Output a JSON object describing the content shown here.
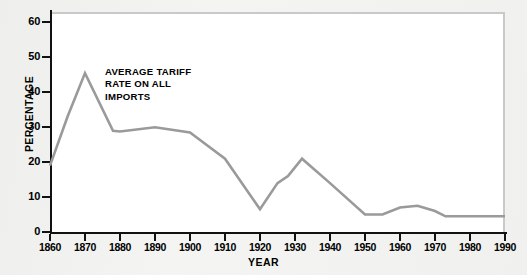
{
  "chart_data": {
    "type": "line",
    "title": "",
    "annotation": "AVERAGE TARIFF\nRATE ON ALL\nIMPORTS",
    "xlabel": "YEAR",
    "ylabel": "PERCENTAGE",
    "xlim": [
      1860,
      1990
    ],
    "ylim": [
      0,
      63
    ],
    "grid": false,
    "legend": false,
    "xticks": [
      1860,
      1870,
      1880,
      1890,
      1900,
      1910,
      1920,
      1930,
      1940,
      1950,
      1960,
      1970,
      1980,
      1990
    ],
    "xtick_labels": [
      "1860",
      "1870",
      "1880",
      "1890",
      "1900",
      "1910",
      "1920",
      "1930",
      "1940",
      "1950",
      "1960",
      "1970",
      "1980",
      "1990"
    ],
    "yticks": [
      0,
      10,
      20,
      30,
      40,
      50,
      60
    ],
    "ytick_labels": [
      "0",
      "10",
      "20",
      "30",
      "40",
      "50",
      "60"
    ],
    "series": [
      {
        "name": "Average tariff rate on all imports",
        "color": "#9a9a9a",
        "x": [
          1860,
          1865,
          1870,
          1878,
          1880,
          1890,
          1900,
          1910,
          1920,
          1925,
          1928,
          1932,
          1940,
          1950,
          1955,
          1960,
          1965,
          1970,
          1973,
          1980,
          1990
        ],
        "y": [
          19.0,
          33.0,
          45.5,
          29.0,
          28.8,
          30.0,
          28.5,
          21.0,
          6.5,
          14.0,
          16.0,
          21.0,
          14.0,
          5.0,
          5.0,
          7.0,
          7.5,
          6.0,
          4.5,
          4.5,
          4.5
        ]
      }
    ]
  }
}
